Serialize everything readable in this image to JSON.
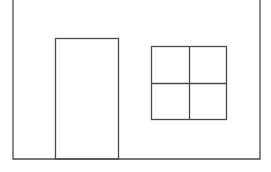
{
  "diagram": {
    "stroke_color": "#4a4a4a",
    "background": "#ffffff",
    "elements": [
      {
        "name": "house-wall",
        "shape": "open-rect",
        "x1": 13,
        "x2": 260,
        "top": 0,
        "bottom": 159
      },
      {
        "name": "door",
        "shape": "rect",
        "x": 55,
        "y": 38,
        "width": 63,
        "height": 121
      },
      {
        "name": "window",
        "shape": "rect",
        "x": 151,
        "y": 46,
        "width": 75,
        "height": 73,
        "panes": 4,
        "mullion_x": 189,
        "transom_y": 83
      }
    ]
  }
}
